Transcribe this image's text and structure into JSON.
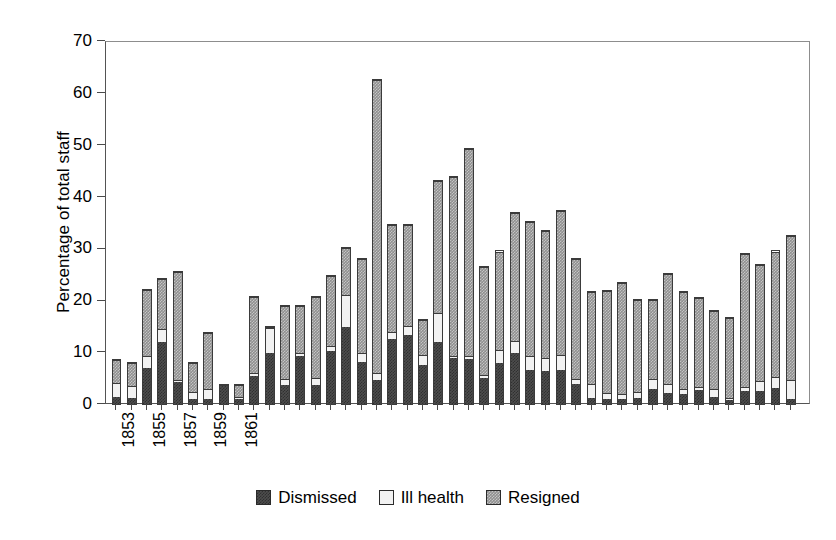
{
  "chart_data": {
    "type": "bar",
    "subtype": "stacked-vertical",
    "title": "",
    "xlabel": "",
    "ylabel": "Percentage of total staff",
    "ylim": [
      0,
      70
    ],
    "ytick_step": 10,
    "yticks": [
      0,
      10,
      20,
      30,
      40,
      50,
      60,
      70
    ],
    "grid": false,
    "legend_position": "bottom-center",
    "legend": [
      "Dismissed",
      "Ill health",
      "Resigned"
    ],
    "colors": {
      "dismissed": "#4d4d4d",
      "ill_health": "#f2f2f2",
      "resigned": "#8f8f8f",
      "axis": "#4a4a4a",
      "background": "#ffffff"
    },
    "categories": [
      "1853",
      "1854",
      "1855",
      "1856",
      "1857",
      "1858",
      "1859",
      "1860",
      "1861",
      "1864",
      "1865",
      "1866",
      "1867",
      "1868",
      "1869",
      "1870",
      "1871",
      "1872",
      "1873",
      "1874",
      "1875",
      "1876",
      "1877",
      "1878",
      "1879",
      "1880",
      "1881",
      "1882",
      "1883",
      "1884",
      "1885",
      "1886",
      "1887",
      "1888",
      "1889",
      "1890",
      "1891",
      "1892",
      "1893",
      "1894",
      "1895",
      "1896",
      "1897",
      "1898",
      "1899"
    ],
    "tick_labels": [
      "1853",
      "1855",
      "1857",
      "1859",
      "1861",
      "1864",
      "1866",
      "1868",
      "1870",
      "1872",
      "1874",
      "1876",
      "1878",
      "1880",
      "1882",
      "1884",
      "1886",
      "1888",
      "1890",
      "1892",
      "1894",
      "1896",
      "1898"
    ],
    "series": [
      {
        "name": "Dismissed",
        "key": "dismissed",
        "values": [
          1.5,
          1.3,
          7.0,
          12.2,
          4.3,
          1.0,
          1.0,
          3.8,
          1.0,
          5.5,
          10.0,
          3.8,
          9.5,
          3.7,
          10.3,
          15.0,
          8.2,
          4.6,
          12.6,
          13.5,
          7.8,
          12.0,
          8.9,
          8.8,
          5.0,
          8.0,
          10.0,
          6.6,
          6.4,
          6.6,
          4.0,
          1.2,
          1.0,
          1.0,
          1.2,
          3.0,
          2.2,
          2.0,
          2.8,
          1.4,
          0.7,
          2.6,
          2.6,
          3.2,
          1.0
        ]
      },
      {
        "name": "Ill health",
        "key": "ill_health",
        "values": [
          2.7,
          2.3,
          2.5,
          2.5,
          0.5,
          1.5,
          1.9,
          0.0,
          0.5,
          0.5,
          5.0,
          1.2,
          0.5,
          1.5,
          1.0,
          6.2,
          1.8,
          1.5,
          1.5,
          1.8,
          1.9,
          5.8,
          0.5,
          0.5,
          0.7,
          2.5,
          2.2,
          2.8,
          2.6,
          3.0,
          0.9,
          2.8,
          1.1,
          1.0,
          1.2,
          2.0,
          1.7,
          1.0,
          0.5,
          1.6,
          0.4,
          0.7,
          2.0,
          2.1,
          3.6
        ]
      },
      {
        "name": "Resigned",
        "key": "resigned",
        "values": [
          4.6,
          4.7,
          12.9,
          9.8,
          21.1,
          5.8,
          11.1,
          0.2,
          2.5,
          15.0,
          0.3,
          14.2,
          9.2,
          15.9,
          13.8,
          9.3,
          18.4,
          56.8,
          20.8,
          19.6,
          6.8,
          25.6,
          34.7,
          40.2,
          21.2,
          19.3,
          25.0,
          26.0,
          24.8,
          28.0,
          23.4,
          18.0,
          20.0,
          21.8,
          18.1,
          15.5,
          21.6,
          19.0,
          17.6,
          15.4,
          15.8,
          26.1,
          22.6,
          24.5,
          28.2
        ]
      }
    ],
    "totals": [
      8.8,
      8.3,
      22.4,
      24.5,
      25.9,
      8.3,
      14.0,
      4.0,
      4.0,
      21.0,
      15.3,
      19.2,
      19.2,
      21.1,
      25.1,
      30.5,
      28.4,
      62.9,
      34.9,
      34.9,
      16.5,
      43.4,
      44.1,
      49.5,
      26.9,
      29.8,
      37.2,
      35.4,
      33.8,
      37.6,
      28.3,
      22.0,
      22.1,
      23.8,
      20.5,
      20.5,
      25.5,
      22.0,
      20.9,
      18.4,
      16.9,
      29.4,
      27.2,
      29.8,
      32.8
    ]
  }
}
